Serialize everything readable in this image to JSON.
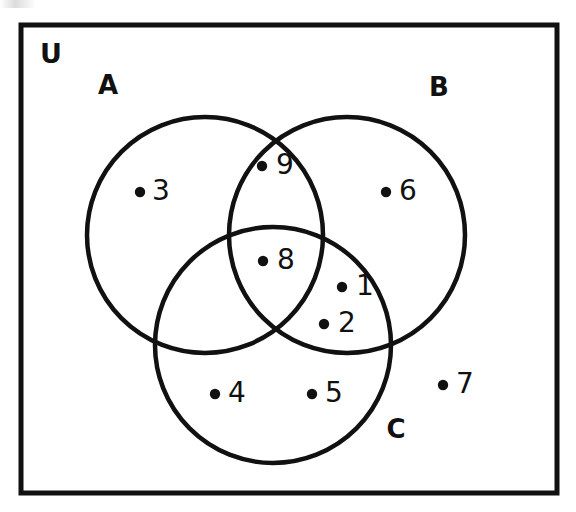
{
  "figure": {
    "type": "venn-diagram",
    "stroke_color": "#111111",
    "background_color": "#ffffff"
  },
  "universe": {
    "label": "U",
    "label_x": 40,
    "label_y": 55,
    "rect": {
      "x": 21,
      "y": 25,
      "width": 536,
      "height": 468,
      "stroke_width": 5
    }
  },
  "sets": [
    {
      "id": "A",
      "label": "A",
      "cx": 205,
      "cy": 235,
      "r": 118,
      "label_x": 108,
      "label_y": 86
    },
    {
      "id": "B",
      "label": "B",
      "cx": 347,
      "cy": 235,
      "r": 118,
      "label_x": 439,
      "label_y": 88
    },
    {
      "id": "C",
      "label": "C",
      "cx": 273,
      "cy": 345,
      "r": 118,
      "label_x": 396,
      "label_y": 430
    }
  ],
  "elements": [
    {
      "label": "3",
      "region": "A only",
      "dot_x": 140,
      "dot_y": 192,
      "text_x": 161,
      "text_y": 192
    },
    {
      "label": "9",
      "region": "A and B",
      "dot_x": 262,
      "dot_y": 166,
      "text_x": 285,
      "text_y": 166
    },
    {
      "label": "6",
      "region": "B only",
      "dot_x": 386,
      "dot_y": 192,
      "text_x": 408,
      "text_y": 192
    },
    {
      "label": "8",
      "region": "A, B and C",
      "dot_x": 263,
      "dot_y": 261,
      "text_x": 286,
      "text_y": 261
    },
    {
      "label": "1",
      "region": "B and C",
      "dot_x": 342,
      "dot_y": 287,
      "text_x": 365,
      "text_y": 287
    },
    {
      "label": "2",
      "region": "B and C",
      "dot_x": 324,
      "dot_y": 324,
      "text_x": 347,
      "text_y": 324
    },
    {
      "label": "4",
      "region": "C only",
      "dot_x": 215,
      "dot_y": 394,
      "text_x": 237,
      "text_y": 394
    },
    {
      "label": "5",
      "region": "C only",
      "dot_x": 312,
      "dot_y": 394,
      "text_x": 334,
      "text_y": 394
    },
    {
      "label": "7",
      "region": "outside sets",
      "dot_x": 443,
      "dot_y": 385,
      "text_x": 465,
      "text_y": 385
    }
  ],
  "chart_data": {
    "type": "diagram",
    "title": "",
    "sets": [
      "A",
      "B",
      "C"
    ],
    "universe_label": "U",
    "regions": {
      "A_only": [
        "3"
      ],
      "B_only": [
        "6"
      ],
      "C_only": [
        "4",
        "5"
      ],
      "A_and_B_only": [
        "9"
      ],
      "A_and_C_only": [],
      "B_and_C_only": [
        "1",
        "2"
      ],
      "A_and_B_and_C": [
        "8"
      ],
      "outside_all": [
        "7"
      ]
    }
  }
}
